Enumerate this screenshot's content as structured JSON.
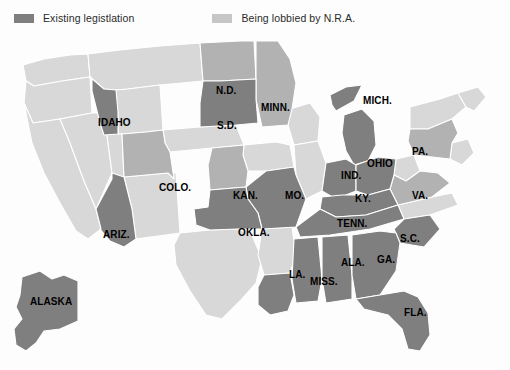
{
  "legend": {
    "items": [
      {
        "label": "Existing legistlation",
        "color": "#807f7f",
        "icon": "legend-swatch-dark"
      },
      {
        "label": "Being lobbied by N.R.A.",
        "color": "#c6c6c6",
        "icon": "legend-swatch-light"
      }
    ]
  },
  "colors": {
    "existing": "#807f7f",
    "lobbied": "#b2b2b2",
    "other": "#d8d8d8",
    "border": "#ffffff",
    "background": "#fdfdfd",
    "label_text": "#000000"
  },
  "map": {
    "title": "United States gun legislation map",
    "categories": {
      "existing": "Existing legistlation",
      "lobbied": "Being lobbied by N.R.A.",
      "other": "No designation"
    },
    "labels": [
      {
        "name": "IDAHO",
        "status": "existing"
      },
      {
        "name": "N.D.",
        "status": "lobbied"
      },
      {
        "name": "S.D.",
        "status": "existing"
      },
      {
        "name": "MINN.",
        "status": "lobbied"
      },
      {
        "name": "MICH.",
        "status": "existing"
      },
      {
        "name": "COLO.",
        "status": "lobbied"
      },
      {
        "name": "KAN.",
        "status": "lobbied"
      },
      {
        "name": "MO.",
        "status": "existing"
      },
      {
        "name": "IND.",
        "status": "existing"
      },
      {
        "name": "OHIO",
        "status": "existing"
      },
      {
        "name": "PA.",
        "status": "lobbied"
      },
      {
        "name": "KY.",
        "status": "existing"
      },
      {
        "name": "VA.",
        "status": "lobbied"
      },
      {
        "name": "ARIZ.",
        "status": "existing"
      },
      {
        "name": "OKLA.",
        "status": "existing"
      },
      {
        "name": "TENN.",
        "status": "existing"
      },
      {
        "name": "S.C.",
        "status": "existing"
      },
      {
        "name": "LA.",
        "status": "existing"
      },
      {
        "name": "MISS.",
        "status": "existing"
      },
      {
        "name": "ALA.",
        "status": "existing"
      },
      {
        "name": "GA.",
        "status": "existing"
      },
      {
        "name": "FLA.",
        "status": "existing"
      },
      {
        "name": "ALASKA",
        "status": "existing"
      }
    ]
  }
}
